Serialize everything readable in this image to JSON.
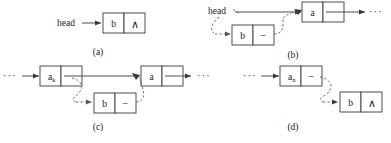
{
  "figure": {
    "stroke_color": "#3a3a3a",
    "dashed_color": "#5a5a5a",
    "background": "#ffffff"
  },
  "symbols": {
    "null_pointer": "∧",
    "ellipsis": "···",
    "stub_pointer": "–",
    "head_label": "head"
  },
  "panels": [
    {
      "id": "a",
      "caption": "(a)",
      "pointer_label": "head",
      "nodes": [
        {
          "name": "node-b",
          "data": "b",
          "pointer": "∧"
        }
      ],
      "left_ellipsis": "",
      "right_ellipsis": ""
    },
    {
      "id": "b",
      "caption": "(b)",
      "pointer_label": "head",
      "nodes": [
        {
          "name": "node-a",
          "data": "a",
          "pointer": ""
        },
        {
          "name": "node-b",
          "data": "b",
          "pointer": "–"
        }
      ],
      "left_ellipsis": "",
      "right_ellipsis": "···"
    },
    {
      "id": "c",
      "caption": "(c)",
      "nodes": [
        {
          "name": "node-ak",
          "data": "a",
          "subscript": "k",
          "pointer": ""
        },
        {
          "name": "node-a",
          "data": "a",
          "pointer": ""
        },
        {
          "name": "node-b",
          "data": "b",
          "pointer": "–"
        }
      ],
      "left_ellipsis": "···",
      "right_ellipsis": "···"
    },
    {
      "id": "d",
      "caption": "(d)",
      "nodes": [
        {
          "name": "node-an",
          "data": "a",
          "subscript": "n",
          "pointer": "–"
        },
        {
          "name": "node-b",
          "data": "b",
          "pointer": "∧"
        }
      ],
      "left_ellipsis": "···",
      "right_ellipsis": ""
    }
  ]
}
